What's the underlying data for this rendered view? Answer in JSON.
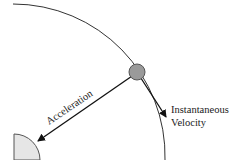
{
  "diagram": {
    "type": "circular-motion",
    "labels": {
      "acceleration": "Acceleration",
      "velocity_line1": "Instantaneous",
      "velocity_line2": "Velocity"
    },
    "colors": {
      "orbit": "#333333",
      "ball_fill": "#9a9a9a",
      "ball_stroke": "#555555",
      "center_fill": "#e6e6e6",
      "center_stroke": "#555555",
      "arrow": "#111111"
    }
  }
}
